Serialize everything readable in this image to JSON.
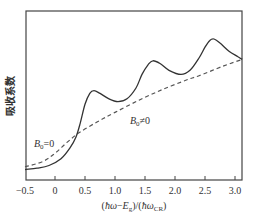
{
  "chart_data": {
    "type": "line",
    "title": "",
    "xlabel": "(ħω−E_g)/(ħω_CR)",
    "xlabel_parts": {
      "open": "(",
      "hbar_omega": "ħω",
      "minus": "−",
      "E": "E",
      "g": "g",
      "mid": ")/(",
      "hbar_omega2": "ħω",
      "CR": "CR",
      "close": ")"
    },
    "ylabel": "吸收系数",
    "xlim": [
      -0.5,
      3.12
    ],
    "ylim": [
      0,
      1
    ],
    "xticks": [
      "-0.5",
      "0",
      "0.5",
      "1.0",
      "1.5",
      "2.0",
      "2.5",
      "3.0"
    ],
    "grid": false,
    "legend": null,
    "annotations": [
      {
        "text": "B0=0",
        "B": "B",
        "sub": "0",
        "rest": "=0",
        "x": -0.38,
        "target_series": "B0=0"
      },
      {
        "text": "B0≠0",
        "B": "B",
        "sub": "0",
        "rest": "≠0",
        "x": 1.3,
        "target_series": "B0≠0"
      }
    ],
    "series": [
      {
        "name": "B0≠0",
        "style": "solid",
        "x": [
          -0.5,
          -0.3,
          -0.1,
          0.1,
          0.25,
          0.35,
          0.42,
          0.5,
          0.58,
          0.65,
          0.75,
          0.9,
          1.05,
          1.2,
          1.35,
          1.45,
          1.55,
          1.63,
          1.75,
          1.9,
          2.1,
          2.25,
          2.4,
          2.5,
          2.58,
          2.65,
          2.75,
          2.9,
          3.05,
          3.12
        ],
        "y": [
          0.04,
          0.05,
          0.07,
          0.12,
          0.2,
          0.28,
          0.38,
          0.52,
          0.6,
          0.62,
          0.6,
          0.56,
          0.54,
          0.56,
          0.64,
          0.74,
          0.81,
          0.84,
          0.82,
          0.77,
          0.74,
          0.77,
          0.86,
          0.94,
          0.99,
          1.0,
          0.97,
          0.91,
          0.87,
          0.85
        ]
      },
      {
        "name": "B0=0",
        "style": "dashed",
        "x": [
          -0.5,
          -0.2,
          0.0,
          0.2,
          0.4,
          0.7,
          1.0,
          1.4,
          1.8,
          2.2,
          2.4,
          2.8,
          3.12
        ],
        "y": [
          0.06,
          0.1,
          0.16,
          0.24,
          0.31,
          0.39,
          0.46,
          0.55,
          0.63,
          0.7,
          0.73,
          0.8,
          0.85
        ]
      }
    ]
  }
}
